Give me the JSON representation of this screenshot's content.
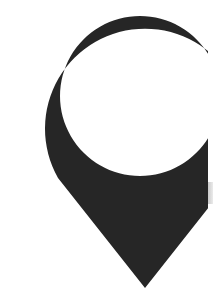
{
  "icon": {
    "name": "map-pin",
    "description": "Cropped location marker pin with circular hole",
    "fill_color": "#262626",
    "hole_color": "#ffffff",
    "background_color": "#ffffff"
  }
}
